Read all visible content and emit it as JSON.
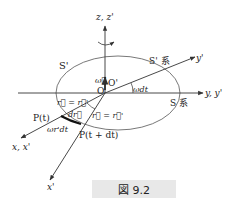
{
  "figure": {
    "caption": "図 9.2",
    "labels": {
      "z_axis": "z, z'",
      "y_axis": "y, y'",
      "y_prime": "y'",
      "x_axis": "x, x'",
      "x_prime": "x'",
      "s_prime_region": "S'",
      "s_prime_system": "S' 系",
      "s_system": "S 系",
      "omega": "ω⃗",
      "origin": "O",
      "origin_prime": "O'",
      "angle": "ωdt",
      "r_eq_1": "r⃗ = r⃗'",
      "r_eq_2": "r⃗ = r⃗'",
      "dr": "dr⃗",
      "p_t": "P(t)",
      "p_t_dt": "P(t + dt)",
      "arc_length": "ωr'dt"
    },
    "colors": {
      "line": "#333333",
      "caption_bg": "#e8e8e8"
    }
  }
}
